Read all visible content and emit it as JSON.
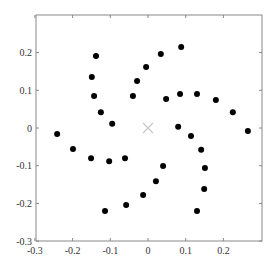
{
  "chart_data": {
    "type": "scatter",
    "title": "",
    "xlabel": "",
    "ylabel": "",
    "xlim": [
      -0.3,
      0.3
    ],
    "ylim": [
      -0.3,
      0.28
    ],
    "grid": false,
    "legend": null,
    "x_ticks": [
      -0.3,
      -0.2,
      -0.1,
      0,
      0.1,
      0.2
    ],
    "x_tick_labels": [
      "-0.3",
      "-0.2",
      "-0.1",
      "0",
      "0.1",
      "0.2"
    ],
    "y_ticks": [
      -0.3,
      -0.2,
      -0.1,
      0,
      0.1,
      0.2
    ],
    "y_tick_labels": [
      "-0.3",
      "-0.2",
      "-0.1",
      "0",
      "0.1",
      "0.2"
    ],
    "series": [
      {
        "name": "points",
        "marker": "filled-circle",
        "color": "#000000",
        "points": [
          [
            -0.138,
            0.191
          ],
          [
            0.034,
            0.196
          ],
          [
            0.088,
            0.215
          ],
          [
            -0.005,
            0.162
          ],
          [
            -0.149,
            0.135
          ],
          [
            -0.029,
            0.125
          ],
          [
            -0.143,
            0.085
          ],
          [
            -0.04,
            0.085
          ],
          [
            0.048,
            0.077
          ],
          [
            0.085,
            0.09
          ],
          [
            0.13,
            0.09
          ],
          [
            0.18,
            0.074
          ],
          [
            0.225,
            0.042
          ],
          [
            0.265,
            -0.008
          ],
          [
            -0.125,
            0.042
          ],
          [
            -0.095,
            0.011
          ],
          [
            -0.241,
            -0.016
          ],
          [
            -0.199,
            -0.056
          ],
          [
            -0.151,
            -0.08
          ],
          [
            -0.103,
            -0.088
          ],
          [
            -0.061,
            -0.08
          ],
          [
            0.08,
            0.003
          ],
          [
            0.114,
            -0.021
          ],
          [
            0.141,
            -0.058
          ],
          [
            0.151,
            -0.106
          ],
          [
            0.149,
            -0.162
          ],
          [
            0.13,
            -0.22
          ],
          [
            0.04,
            -0.101
          ],
          [
            0.021,
            -0.141
          ],
          [
            -0.013,
            -0.178
          ],
          [
            -0.058,
            -0.204
          ],
          [
            -0.114,
            -0.22
          ]
        ]
      },
      {
        "name": "center",
        "marker": "x",
        "color": "#c8c8c8",
        "points": [
          [
            0,
            0
          ]
        ]
      }
    ]
  },
  "colors": {
    "axis": "#888888",
    "tick_text": "#333333",
    "point": "#000000",
    "center_marker": "#c8c8c8"
  }
}
